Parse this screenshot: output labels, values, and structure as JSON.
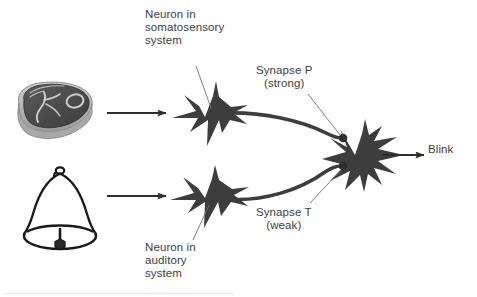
{
  "figure": {
    "background": "#ffffff",
    "ink": "#3d3d3d",
    "neuron_fill": "#3d3d3d",
    "steak_dark": "#4a4a4a",
    "steak_rim": "#b9b9b9",
    "bell_outline": "#1a1a1a"
  },
  "labels": {
    "somatosensory": "Neuron in\nsomatosensory\nsystem",
    "auditory": "Neuron in\nauditory\nsystem",
    "synapse_p": "Synapse P\n(strong)",
    "synapse_t": "Synapse T\n(weak)",
    "blink": "Blink"
  },
  "diagram_data": {
    "type": "diagram",
    "stimuli": [
      {
        "name": "steak-icon",
        "meaning": "food / unconditioned stimulus",
        "position": "top-left"
      },
      {
        "name": "bell-icon",
        "meaning": "tone / conditioned stimulus",
        "position": "bottom-left"
      }
    ],
    "nodes": [
      {
        "id": "somatosensory-neuron",
        "label": "Neuron in somatosensory system",
        "x": 205,
        "y": 117
      },
      {
        "id": "auditory-neuron",
        "label": "Neuron in auditory system",
        "x": 205,
        "y": 198
      },
      {
        "id": "motor-neuron",
        "label": "output neuron",
        "x": 355,
        "y": 155
      }
    ],
    "synapses": [
      {
        "id": "synapse-p",
        "label": "Synapse P",
        "strength": "(strong)",
        "from": "somatosensory-neuron",
        "to": "motor-neuron",
        "x": 343,
        "y": 138
      },
      {
        "id": "synapse-t",
        "label": "Synapse T",
        "strength": "(weak)",
        "from": "auditory-neuron",
        "to": "motor-neuron",
        "x": 343,
        "y": 167
      }
    ],
    "output": {
      "label": "Blink",
      "from": "motor-neuron"
    },
    "arrows": [
      {
        "from": "steak-icon",
        "to": "somatosensory-neuron"
      },
      {
        "from": "bell-icon",
        "to": "auditory-neuron"
      },
      {
        "from": "motor-neuron",
        "to": "Blink"
      }
    ]
  }
}
